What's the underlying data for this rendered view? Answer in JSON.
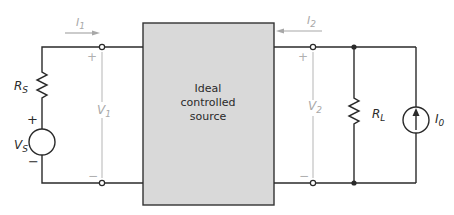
{
  "diagram": {
    "block": {
      "label_lines": [
        "Ideal",
        "controlled",
        "source"
      ],
      "fill": "#d9d9d9",
      "stroke": "#333333"
    },
    "source_side": {
      "source_resistor": {
        "symbol": "R",
        "subscript": "S"
      },
      "voltage_source": {
        "symbol": "V",
        "subscript": "S",
        "plus": "+",
        "minus": "−"
      },
      "port_current": {
        "symbol": "I",
        "subscript": "1",
        "direction": "right"
      },
      "port_voltage": {
        "symbol": "V",
        "subscript": "1",
        "plus": "+",
        "minus": "−"
      }
    },
    "load_side": {
      "port_current": {
        "symbol": "I",
        "subscript": "2",
        "direction": "left"
      },
      "port_voltage": {
        "symbol": "V",
        "subscript": "2",
        "plus": "+",
        "minus": "−"
      },
      "load_resistor": {
        "symbol": "R",
        "subscript": "L"
      },
      "current_source": {
        "symbol": "I",
        "subscript": "0",
        "direction": "up"
      }
    },
    "colors": {
      "wire": "#2a2a2a",
      "annotation": "#a8a8a8"
    }
  }
}
